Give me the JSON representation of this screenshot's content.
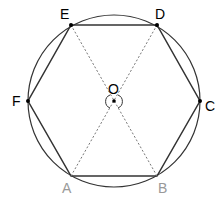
{
  "diagram": {
    "center": {
      "label": "O",
      "x": 114,
      "y": 101
    },
    "radius": 86,
    "vertices": [
      {
        "label": "A",
        "x": 71,
        "y": 176,
        "color": "#999999"
      },
      {
        "label": "B",
        "x": 157,
        "y": 176,
        "color": "#999999"
      },
      {
        "label": "C",
        "x": 200,
        "y": 101,
        "color": "#000000"
      },
      {
        "label": "D",
        "x": 157,
        "y": 25,
        "color": "#000000"
      },
      {
        "label": "E",
        "x": 71,
        "y": 25,
        "color": "#000000"
      },
      {
        "label": "F",
        "x": 28,
        "y": 101,
        "color": "#000000"
      }
    ],
    "labels": {
      "A": "A",
      "B": "B",
      "C": "C",
      "D": "D",
      "E": "E",
      "F": "F",
      "O": "O"
    },
    "diagonals": [
      "AD",
      "BE"
    ],
    "angle_marks": "vertical angles at O (left and right)"
  }
}
